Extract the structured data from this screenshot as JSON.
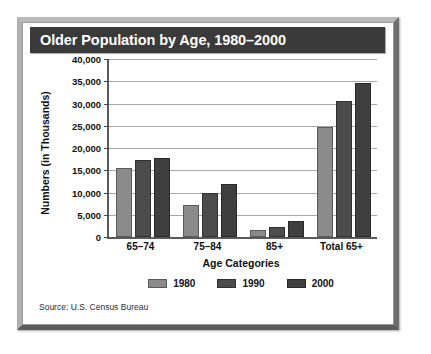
{
  "chart_data": {
    "type": "bar",
    "title": "Older Population by Age, 1980–2000",
    "xlabel": "Age Categories",
    "ylabel": "Numbers (in Thousands)",
    "categories": [
      "65–74",
      "75–84",
      "85+",
      "Total 65+"
    ],
    "series": [
      {
        "name": "1980",
        "color": "#8b8b8b",
        "values": [
          15600,
          7200,
          1500,
          24800
        ]
      },
      {
        "name": "1990",
        "color": "#4c4c4c",
        "values": [
          17400,
          10000,
          2300,
          30600
        ]
      },
      {
        "name": "2000",
        "color": "#3f3f3f",
        "values": [
          17800,
          12000,
          3500,
          34500
        ]
      }
    ],
    "ylim": [
      0,
      40000
    ],
    "ytick_values": [
      0,
      5000,
      10000,
      15000,
      20000,
      25000,
      30000,
      35000,
      40000
    ],
    "ytick_labels": [
      "0",
      "5,000",
      "10,000",
      "15,000",
      "20,000",
      "25,000",
      "30,000",
      "35,000",
      "40,000"
    ],
    "grid": true,
    "legend_position": "bottom",
    "source": "Source: U.S. Census Bureau"
  },
  "colors": {
    "title_banner_bg": "#3a3a3a",
    "title_text": "#ffffff",
    "axis": "#5a5a5a",
    "gridline": "#a8a8a8",
    "card_bg": "#ffffff",
    "frame": "#9a9a9a"
  }
}
